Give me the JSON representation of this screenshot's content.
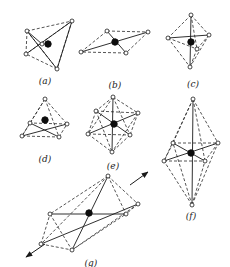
{
  "figure": {
    "panels": [
      {
        "id": "a",
        "label": "(a)",
        "center": [
          48,
          44
        ],
        "nodes": [
          [
            27,
            31
          ],
          [
            72,
            21
          ],
          [
            26,
            54
          ],
          [
            57,
            69
          ],
          [
            42,
            44
          ]
        ],
        "solid": [
          [
            0,
            3
          ],
          [
            1,
            2
          ],
          [
            1,
            3
          ],
          [
            0,
            4
          ]
        ],
        "dashed": [
          [
            0,
            1
          ],
          [
            1,
            3
          ],
          [
            3,
            2
          ],
          [
            2,
            0
          ],
          [
            0,
            3
          ],
          [
            1,
            2
          ]
        ],
        "label_pos": [
          45,
          84
        ]
      },
      {
        "id": "b",
        "label": "(b)",
        "center": [
          115,
          42
        ],
        "nodes": [
          [
            81,
            52
          ],
          [
            107,
            31
          ],
          [
            148,
            32
          ],
          [
            126,
            53
          ]
        ],
        "solid": [
          [
            0,
            2
          ],
          [
            1,
            3
          ]
        ],
        "dashed": [
          [
            0,
            1
          ],
          [
            1,
            2
          ],
          [
            2,
            3
          ],
          [
            3,
            0
          ]
        ],
        "label_pos": [
          115,
          88
        ]
      },
      {
        "id": "c",
        "label": "(c)",
        "center": [
          191,
          42
        ],
        "nodes": [
          [
            191,
            15
          ],
          [
            168,
            38
          ],
          [
            209,
            35
          ],
          [
            190,
            67
          ],
          [
            197,
            49
          ]
        ],
        "solid": [
          [
            0,
            3
          ],
          [
            1,
            2
          ]
        ],
        "dashed": [
          [
            0,
            1
          ],
          [
            0,
            2
          ],
          [
            1,
            3
          ],
          [
            2,
            3
          ],
          [
            1,
            4
          ],
          [
            0,
            4
          ],
          [
            4,
            3
          ],
          [
            2,
            4
          ]
        ],
        "label_pos": [
          193,
          87
        ]
      },
      {
        "id": "d",
        "label": "(d)",
        "center": [
          45,
          120
        ],
        "nodes": [
          [
            45,
            99
          ],
          [
            22,
            136
          ],
          [
            59,
            137
          ],
          [
            67,
            124
          ],
          [
            30,
            123
          ]
        ],
        "solid": [
          [
            1,
            3
          ],
          [
            2,
            4
          ]
        ],
        "dashed": [
          [
            0,
            1
          ],
          [
            0,
            2
          ],
          [
            0,
            3
          ],
          [
            0,
            4
          ],
          [
            1,
            2
          ],
          [
            2,
            3
          ],
          [
            3,
            4
          ],
          [
            4,
            1
          ]
        ],
        "label_pos": [
          45,
          162
        ]
      },
      {
        "id": "e",
        "label": "(e)",
        "center": [
          114,
          124
        ],
        "nodes": [
          [
            113,
            97
          ],
          [
            96,
            111
          ],
          [
            138,
            113
          ],
          [
            88,
            134
          ],
          [
            130,
            135
          ],
          [
            112,
            152
          ]
        ],
        "solid": [
          [
            0,
            5
          ],
          [
            1,
            4
          ],
          [
            2,
            3
          ]
        ],
        "dashed": [
          [
            0,
            1
          ],
          [
            0,
            2
          ],
          [
            1,
            3
          ],
          [
            2,
            4
          ],
          [
            3,
            5
          ],
          [
            4,
            5
          ],
          [
            1,
            2
          ],
          [
            3,
            4
          ],
          [
            0,
            3
          ],
          [
            0,
            4
          ],
          [
            1,
            5
          ],
          [
            2,
            5
          ]
        ],
        "label_pos": [
          113,
          169
        ]
      },
      {
        "id": "f",
        "label": "(f)",
        "center": [
          191,
          153
        ],
        "nodes": [
          [
            193,
            99
          ],
          [
            192,
            205
          ],
          [
            164,
            161
          ],
          [
            218,
            143
          ],
          [
            173,
            143
          ],
          [
            205,
            161
          ]
        ],
        "solid": [
          [
            0,
            1
          ],
          [
            2,
            3
          ],
          [
            4,
            5
          ]
        ],
        "dashed": [
          [
            0,
            2
          ],
          [
            0,
            3
          ],
          [
            0,
            4
          ],
          [
            0,
            5
          ],
          [
            1,
            2
          ],
          [
            1,
            3
          ],
          [
            1,
            4
          ],
          [
            1,
            5
          ],
          [
            4,
            3
          ],
          [
            2,
            5
          ],
          [
            4,
            2
          ],
          [
            3,
            5
          ]
        ],
        "label_pos": [
          191,
          219
        ]
      },
      {
        "id": "g",
        "label": "(g)",
        "center": [
          89,
          213
        ],
        "nodes": [
          [
            108,
            176
          ],
          [
            138,
            204
          ],
          [
            41,
            244
          ],
          [
            72,
            250
          ],
          [
            50,
            214
          ],
          [
            126,
            214
          ]
        ],
        "solid": [
          [
            0,
            3
          ],
          [
            2,
            1
          ],
          [
            4,
            5
          ]
        ],
        "dashed": [
          [
            0,
            1
          ],
          [
            0,
            4
          ],
          [
            0,
            5
          ],
          [
            2,
            4
          ],
          [
            2,
            3
          ],
          [
            3,
            5
          ],
          [
            1,
            5
          ],
          [
            4,
            3
          ],
          [
            0,
            2
          ],
          [
            1,
            3
          ]
        ],
        "arrows": [
          [
            [
              130,
              185
            ],
            [
              148,
              172
            ]
          ],
          [
            [
              45,
              244
            ],
            [
              26,
              257
            ]
          ]
        ],
        "label_pos": [
          91,
          266
        ]
      }
    ]
  }
}
